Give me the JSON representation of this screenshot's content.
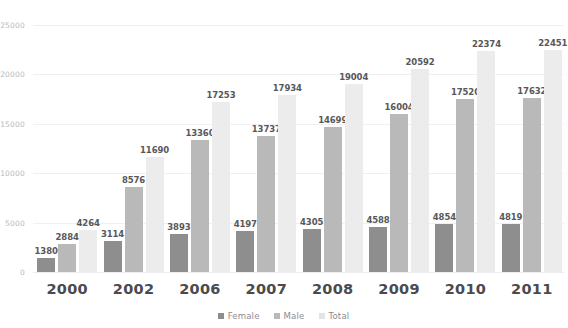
{
  "chart_data": {
    "type": "bar",
    "title": "",
    "xlabel": "",
    "ylabel": "",
    "ylim": [
      0,
      25000
    ],
    "yticks": [
      0,
      5000,
      10000,
      15000,
      20000,
      25000
    ],
    "ytick_labels": [
      "0",
      "5000",
      "10000",
      "15000",
      "20000",
      "25000"
    ],
    "grid": true,
    "legend_position": "bottom-center",
    "categories": [
      "2000",
      "2002",
      "2006",
      "2007",
      "2008",
      "2009",
      "2010",
      "2011"
    ],
    "series": [
      {
        "name": "Female",
        "color": "#8e8e8e",
        "values": [
          1380,
          3114,
          3893,
          4197,
          4305,
          4588,
          4854,
          4819
        ],
        "labels": [
          "1380",
          "3114",
          "3893",
          "4197",
          "4305",
          "4588",
          "4854",
          "4819"
        ]
      },
      {
        "name": "Male",
        "color": "#b9b9b9",
        "values": [
          2884,
          8576,
          13360,
          13737,
          14699,
          16004,
          17520,
          17632
        ],
        "labels": [
          "2884",
          "8576",
          "13360",
          "13737",
          "14699",
          "16004",
          "17520",
          "17632"
        ]
      },
      {
        "name": "Total",
        "color": "#ececec",
        "values": [
          4264,
          11690,
          17253,
          17934,
          19004,
          20592,
          22374,
          22451
        ],
        "labels": [
          "4264",
          "11690",
          "17253",
          "17934",
          "19004",
          "20592",
          "22374",
          "22451"
        ]
      }
    ]
  },
  "legend": {
    "items": [
      {
        "label": "Female",
        "color": "#8e8e8e"
      },
      {
        "label": "Male",
        "color": "#b9b9b9"
      },
      {
        "label": "Total",
        "color": "#e4e4e4"
      }
    ]
  }
}
